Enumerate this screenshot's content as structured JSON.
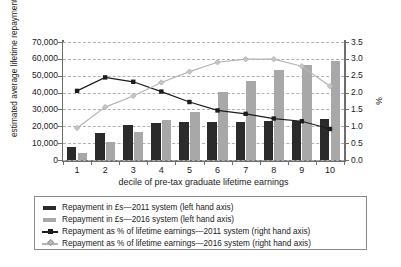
{
  "chart_data": {
    "type": "bar",
    "title": "",
    "subtitle": "",
    "xlabel": "decile of pre-tax graduate lifetime earnings",
    "ylabel": "estimated average lifetime repayments (£)",
    "y2label": "%",
    "categories": [
      "1",
      "2",
      "3",
      "4",
      "5",
      "6",
      "7",
      "8",
      "9",
      "10"
    ],
    "ylim": [
      0,
      70000
    ],
    "yticks": [
      "0",
      "10,000",
      "20,000",
      "30,000",
      "40,000",
      "50,000",
      "60,000",
      "70,000"
    ],
    "ytick_values": [
      0,
      10000,
      20000,
      30000,
      40000,
      50000,
      60000,
      70000
    ],
    "y2lim": [
      0,
      3.5
    ],
    "y2ticks": [
      "0.0",
      "0.5",
      "1.0",
      "1.5",
      "2.0",
      "2.5",
      "3.0",
      "3.5"
    ],
    "y2tick_values": [
      0,
      0.5,
      1.0,
      1.5,
      2.0,
      2.5,
      3.0,
      3.5
    ],
    "grid": true,
    "legend_position": "bottom",
    "series": [
      {
        "name": "Repayment in £s—2011 system (left hand axis)",
        "type": "bar",
        "axis": "left",
        "color": "#2b2b2b",
        "values": [
          8000,
          16300,
          20700,
          22200,
          22700,
          22700,
          22800,
          23000,
          23200,
          24300
        ]
      },
      {
        "name": "Repayment in £s—2016 system (left hand axis)",
        "type": "bar",
        "axis": "left",
        "color": "#a8a8a8",
        "values": [
          4000,
          10500,
          16400,
          23900,
          28200,
          40200,
          46700,
          53500,
          56600,
          59000
        ]
      },
      {
        "name": "Repayment as % of lifetime earnings—2011 system (right hand axis)",
        "type": "line",
        "axis": "right",
        "color": "#1c1c1c",
        "marker": "square",
        "values": [
          2.05,
          2.45,
          2.32,
          2.03,
          1.72,
          1.47,
          1.37,
          1.23,
          1.15,
          0.92
        ]
      },
      {
        "name": "Repayment as % of lifetime earnings—2016 system (right hand axis)",
        "type": "line",
        "axis": "right",
        "color": "#b4b4b4",
        "marker": "diamond",
        "values": [
          0.95,
          1.57,
          1.9,
          2.3,
          2.62,
          2.9,
          2.99,
          2.99,
          2.78,
          2.19
        ]
      }
    ]
  },
  "legend": {
    "items": [
      {
        "label": "Repayment in £s—2011 system (left hand axis)",
        "key": "bar-dark"
      },
      {
        "label": "Repayment in £s—2016 system (left hand axis)",
        "key": "bar-gray"
      },
      {
        "label": "Repayment as % of lifetime earnings—2011 system (right hand axis)",
        "key": "line-dark"
      },
      {
        "label": "Repayment as % of lifetime earnings—2016 system (right hand axis)",
        "key": "line-gray"
      }
    ]
  },
  "colors": {
    "bar_2011": "#2b2b2b",
    "bar_2016": "#a8a8a8",
    "line_2011": "#1c1c1c",
    "line_2016": "#b4b4b4",
    "grid": "#b0b0b0",
    "axis": "#6e6e6e"
  }
}
